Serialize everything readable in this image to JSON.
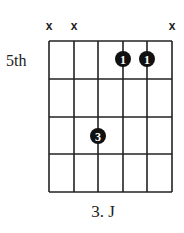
{
  "chord": {
    "caption": "3. J",
    "start_fret_label": "5th",
    "strings": 6,
    "frets_shown": 4,
    "muted_strings": [
      1,
      2,
      6
    ],
    "mute_symbol": "x",
    "fingers": [
      {
        "string": 4,
        "fret": 1,
        "finger": "1"
      },
      {
        "string": 5,
        "fret": 1,
        "finger": "1"
      },
      {
        "string": 3,
        "fret": 3,
        "finger": "3"
      }
    ]
  },
  "colors": {
    "line": "#222222",
    "dot": "#111111",
    "dot_text": "#ffffff",
    "background": "#ffffff"
  }
}
